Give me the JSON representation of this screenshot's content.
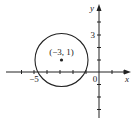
{
  "figure": {
    "type": "coordinate-plane-circle",
    "axes": {
      "x_label": "x",
      "y_label": "y",
      "origin_label": "0",
      "x_tick_label": "−5",
      "y_tick_label": "3"
    },
    "circle": {
      "center_label": "(−3, 1)",
      "center": [
        -3,
        1
      ],
      "radius": 2.2
    },
    "colors": {
      "stroke": "#222222",
      "background": "#ffffff"
    }
  }
}
